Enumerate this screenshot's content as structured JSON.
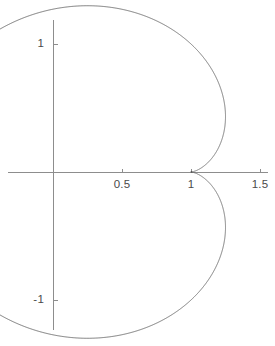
{
  "chart_data": {
    "type": "line",
    "title": "",
    "subtitle": "",
    "xlabel": "",
    "ylabel": "",
    "grid": false,
    "legend": null,
    "axis_color": "#8d8d8d",
    "curve_color": "#6b6b6b",
    "background": "#ffffff",
    "xlim": [
      -0.33,
      1.6
    ],
    "ylim": [
      -1.35,
      1.35
    ],
    "xticks": [
      0.5,
      1,
      1.5
    ],
    "xtick_labels": [
      "0.5",
      "1",
      "1.5"
    ],
    "yticks": [
      1,
      -1
    ],
    "ytick_labels": [
      "1",
      "-1"
    ],
    "origin_px": {
      "x": 53,
      "y": 172
    },
    "scale_px": {
      "x": 138,
      "y": 128
    },
    "x_axis_extent_px": {
      "start": 8,
      "end": 268
    },
    "y_axis_extent_px": {
      "start": 20,
      "end": 330
    },
    "series": [
      {
        "name": "parametric-curve",
        "param": "t",
        "t_range": [
          0,
          6.283185307179586
        ],
        "t_steps": 2000,
        "x_expr": "cos(t) - cos(2*t)*0.5 + 0.5",
        "y_expr": "sin(t) - sin(2*t)*0.5",
        "closed": true,
        "features": {
          "passes_through_origin": true,
          "self_intersections_px": [
            {
              "x": 186,
              "y": 48
            },
            {
              "x": 185,
              "y": 307
            }
          ],
          "leftmost_px": 38,
          "rightmost_px": 252,
          "topmost_px": 22,
          "bottommost_px": 326
        }
      }
    ]
  }
}
